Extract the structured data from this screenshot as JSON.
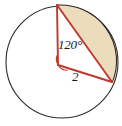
{
  "figure": {
    "name": "circle-sector-segment-diagram",
    "background_color": "#ffffff",
    "circle": {
      "name": "circle-outline",
      "center_x": 62,
      "center_y": 62,
      "radius": 56,
      "stroke_color": "#2b2b2b",
      "stroke_width": 1.1,
      "fill_color": "#ffffff"
    },
    "vertex": {
      "name": "angle-vertex",
      "x": 58,
      "y": 65
    },
    "points": {
      "top_vertex": {
        "name": "arc-endpoint-top",
        "x": 57,
        "y": 5
      },
      "right_vertex": {
        "name": "arc-endpoint-right",
        "x": 112,
        "y": 82
      }
    },
    "segment_fill": {
      "name": "shaded-circular-segment",
      "fill_color": "#ebdcbb"
    },
    "lines": {
      "name": "triangle-lines",
      "stroke_color": "#c0392b",
      "stroke_width": 1.8
    },
    "angle_marker": {
      "name": "angle-arc-marker",
      "stroke_color": "#c0392b",
      "radius": 11
    },
    "labels": {
      "angle": "120°",
      "radius": "2"
    }
  }
}
